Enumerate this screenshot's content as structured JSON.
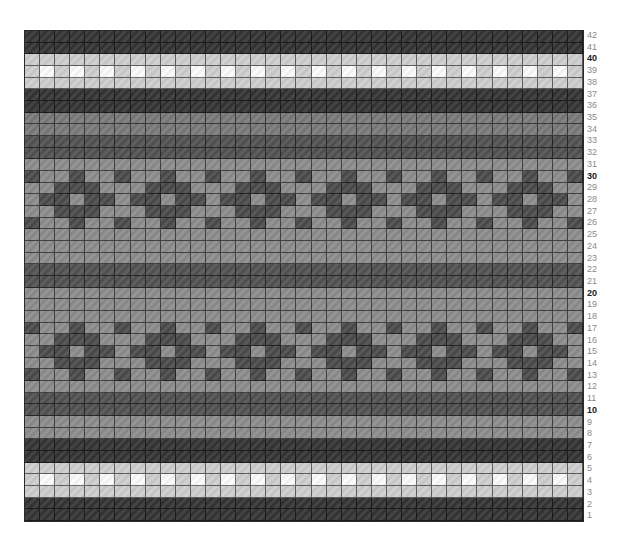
{
  "chart": {
    "title": "",
    "type": "knitting-colorwork-chart",
    "columns": 37,
    "rows": 42,
    "row_labels": [
      "42",
      "41",
      "40",
      "39",
      "38",
      "37",
      "36",
      "35",
      "34",
      "33",
      "32",
      "31",
      "30",
      "29",
      "28",
      "27",
      "26",
      "25",
      "24",
      "23",
      "22",
      "21",
      "20",
      "19",
      "18",
      "17",
      "16",
      "15",
      "14",
      "13",
      "12",
      "11",
      "10",
      "9",
      "8",
      "7",
      "6",
      "5",
      "4",
      "3",
      "2",
      "1"
    ],
    "bold_row_labels": [
      "40",
      "30",
      "20",
      "10"
    ],
    "colors": {
      "dark": "#353535",
      "darker_mid": "#525252",
      "mid": "#8c8c8c",
      "mid_dark": "#7a7a7a",
      "motif_dark": "#4b4b4b",
      "light": "#cdcdcd",
      "white": "#fafafa"
    },
    "row_types_top_to_bottom": [
      "dark",
      "dark",
      "light",
      "checker",
      "light",
      "dark",
      "dark",
      "mid_dark",
      "mid_dark",
      "darker_mid",
      "darker_mid",
      "mid",
      "motif_a",
      "motif_b",
      "motif_c",
      "motif_b",
      "motif_a",
      "mid",
      "mid",
      "mid",
      "darker_mid",
      "darker_mid",
      "mid",
      "mid",
      "mid",
      "motif_a",
      "motif_b",
      "motif_c",
      "motif_b",
      "motif_a",
      "mid",
      "darker_mid",
      "darker_mid",
      "mid",
      "mid",
      "dark",
      "dark",
      "light",
      "checker",
      "light",
      "dark",
      "dark"
    ],
    "motif_rules": {
      "motif_a": "dark where col % 3 == 0",
      "motif_b": "dark where col % 6 in [2,3,4]",
      "motif_c": "light where col % 3 == 0, else dark",
      "checker": "white where col is odd, else light"
    }
  }
}
